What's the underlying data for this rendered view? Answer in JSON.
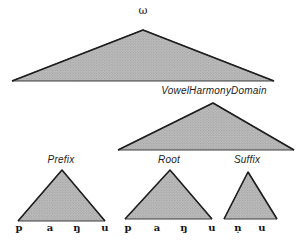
{
  "diagram": {
    "prosodic_word": {
      "label": "ω"
    },
    "vowel_harmony_domain": {
      "label": "VowelHarmonyDomain"
    },
    "constituents": {
      "prefix": {
        "label": "Prefix",
        "segments": [
          "p",
          "a",
          "ŋ",
          "u"
        ]
      },
      "root": {
        "label": "Root",
        "segments": [
          "p",
          "a",
          "ŋ",
          "u"
        ]
      },
      "suffix": {
        "label": "Suffix",
        "segments": [
          "ṇ",
          "u"
        ]
      }
    },
    "colors": {
      "triangle_fill": "#b5b5b5",
      "triangle_stroke": "#1f1f1f",
      "background": "#ffffff",
      "text": "#1b1b1b"
    }
  }
}
